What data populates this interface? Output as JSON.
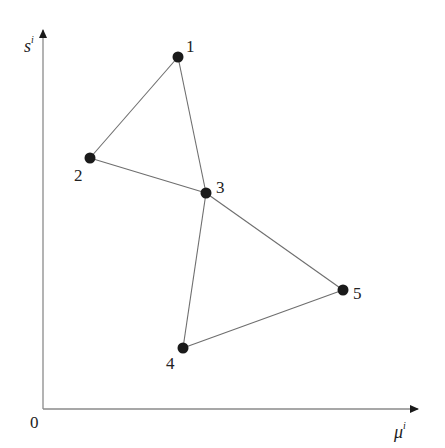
{
  "diagram": {
    "type": "graph",
    "axes": {
      "origin_label": "0",
      "x_label": "μ",
      "x_label_sup": "i",
      "y_label": "s",
      "y_label_sup": "i",
      "origin_px": [
        43,
        409
      ],
      "x_end_px": [
        420,
        409
      ],
      "y_end_px": [
        43,
        28
      ]
    },
    "nodes": [
      {
        "id": "1",
        "label": "1",
        "x": 178,
        "y": 57,
        "lx": 186,
        "ly": 52
      },
      {
        "id": "2",
        "label": "2",
        "x": 90,
        "y": 158,
        "lx": 74,
        "ly": 181
      },
      {
        "id": "3",
        "label": "3",
        "x": 206,
        "y": 193,
        "lx": 216,
        "ly": 193
      },
      {
        "id": "4",
        "label": "4",
        "x": 183,
        "y": 348,
        "lx": 166,
        "ly": 369
      },
      {
        "id": "5",
        "label": "5",
        "x": 343,
        "y": 290,
        "lx": 353,
        "ly": 299
      }
    ],
    "edges": [
      [
        "1",
        "2"
      ],
      [
        "1",
        "3"
      ],
      [
        "2",
        "3"
      ],
      [
        "3",
        "4"
      ],
      [
        "3",
        "5"
      ],
      [
        "4",
        "5"
      ]
    ],
    "colors": {
      "node": "#1a1a1a",
      "edge": "#6e6e6e",
      "axis": "#8a8a8a",
      "text": "#222222"
    }
  }
}
